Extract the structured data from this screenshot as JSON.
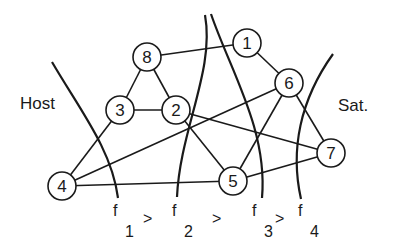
{
  "diagram": {
    "type": "graph-partition",
    "side_labels": {
      "left": "Host",
      "right": "Sat."
    },
    "nodes": [
      {
        "id": "1",
        "label": "1",
        "x": 247,
        "y": 43
      },
      {
        "id": "2",
        "label": "2",
        "x": 176,
        "y": 110
      },
      {
        "id": "3",
        "label": "3",
        "x": 120,
        "y": 110
      },
      {
        "id": "4",
        "label": "4",
        "x": 62,
        "y": 186
      },
      {
        "id": "5",
        "label": "5",
        "x": 233,
        "y": 181
      },
      {
        "id": "6",
        "label": "6",
        "x": 289,
        "y": 83
      },
      {
        "id": "7",
        "label": "7",
        "x": 331,
        "y": 153
      },
      {
        "id": "8",
        "label": "8",
        "x": 147,
        "y": 57
      }
    ],
    "edges": [
      [
        "8",
        "1"
      ],
      [
        "8",
        "3"
      ],
      [
        "8",
        "2"
      ],
      [
        "3",
        "2"
      ],
      [
        "1",
        "6"
      ],
      [
        "3",
        "4"
      ],
      [
        "4",
        "6"
      ],
      [
        "4",
        "5"
      ],
      [
        "2",
        "5"
      ],
      [
        "2",
        "7"
      ],
      [
        "6",
        "5"
      ],
      [
        "6",
        "7"
      ],
      [
        "5",
        "7"
      ]
    ],
    "cuts": [
      {
        "name": "f",
        "sub": "1",
        "relation": ">"
      },
      {
        "name": "f",
        "sub": "2",
        "relation": ">"
      },
      {
        "name": "f",
        "sub": "3",
        "relation": ">"
      },
      {
        "name": "f",
        "sub": "4",
        "relation": ""
      }
    ]
  }
}
